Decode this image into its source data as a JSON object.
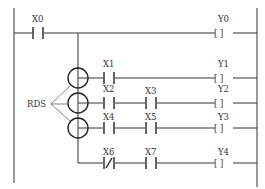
{
  "diagram": {
    "type": "ladder-logic",
    "annotation": "RDS",
    "rungs": [
      {
        "contacts": [
          {
            "label": "X0",
            "type": "NO"
          }
        ],
        "coil": "Y0"
      },
      {
        "contacts": [
          {
            "label": "X1",
            "type": "NO"
          }
        ],
        "coil": "Y1",
        "marked": true
      },
      {
        "contacts": [
          {
            "label": "X2",
            "type": "NO"
          },
          {
            "label": "X3",
            "type": "NO"
          }
        ],
        "coil": "Y2",
        "marked": true
      },
      {
        "contacts": [
          {
            "label": "X4",
            "type": "NO"
          },
          {
            "label": "X5",
            "type": "NO"
          }
        ],
        "coil": "Y3",
        "marked": true
      },
      {
        "contacts": [
          {
            "label": "X6",
            "type": "NC"
          },
          {
            "label": "X7",
            "type": "NO"
          }
        ],
        "coil": "Y4"
      }
    ],
    "coil_symbol": "[ ]"
  }
}
